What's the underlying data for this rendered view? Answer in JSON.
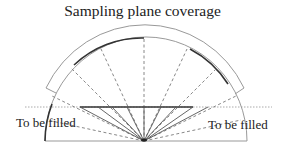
{
  "title": "Sampling plane coverage",
  "labels": {
    "left": "To be filled",
    "right": "To be filled"
  },
  "geometry": {
    "center": [
      144,
      141
    ],
    "inner_radius": 103,
    "outer_radius": 113,
    "chord_y": 107,
    "dotted_line_x": [
      25,
      272
    ],
    "chord_x": [
      80,
      193
    ],
    "baseline_x": [
      45,
      247
    ]
  },
  "colors": {
    "line_dark": "#333333",
    "line_light": "#999999",
    "dashed": "#888888",
    "dotted": "#aaaaaa",
    "text": "#222222"
  }
}
